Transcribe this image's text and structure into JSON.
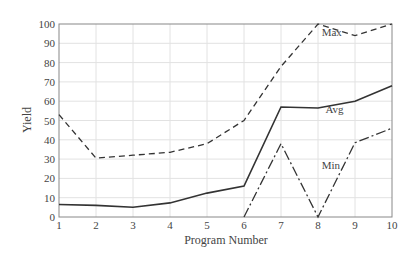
{
  "chart_data": {
    "type": "line",
    "title": "",
    "xlabel": "Program Number",
    "ylabel": "Yield",
    "x": [
      1,
      2,
      3,
      4,
      5,
      6,
      7,
      8,
      9,
      10
    ],
    "xticks": [
      "1",
      "2",
      "3",
      "4",
      "5",
      "6",
      "7",
      "8",
      "9",
      "10"
    ],
    "yticks": [
      "0",
      "10",
      "20",
      "30",
      "40",
      "50",
      "60",
      "70",
      "80",
      "90",
      "100"
    ],
    "xlim": [
      1,
      10
    ],
    "ylim": [
      0,
      100
    ],
    "grid": true,
    "legend_position": "inline labels",
    "series": [
      {
        "name": "Max",
        "style": "dashed",
        "values": [
          53,
          30.5,
          32,
          33.5,
          38,
          50,
          78,
          100,
          94,
          100
        ],
        "label_pos": [
          8.1,
          94
        ]
      },
      {
        "name": "Avg",
        "style": "solid",
        "values": [
          6.5,
          6,
          5,
          7.3,
          12.4,
          16,
          57,
          56.5,
          60,
          68
        ],
        "label_pos": [
          8.2,
          54
        ]
      },
      {
        "name": "Min",
        "style": "dashdot",
        "values": [
          null,
          null,
          null,
          null,
          null,
          0,
          38,
          0,
          38.5,
          46
        ],
        "label_pos": [
          8.1,
          25
        ]
      }
    ]
  }
}
